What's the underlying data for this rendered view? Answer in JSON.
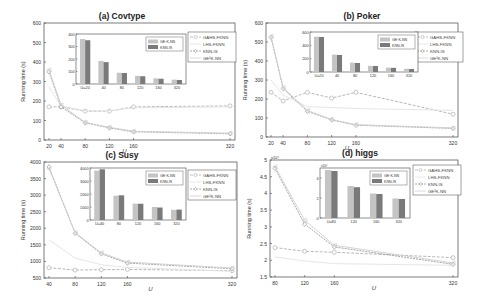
{
  "figure": {
    "ylabel": "Running time (s)",
    "xlabel": "U"
  },
  "legend_main": [
    "GAHS-FKNN",
    "LHS-FKNN",
    "KNN-IS",
    "GE²K-NN"
  ],
  "legend_inset": [
    "GE²K-NN",
    "KNN-IS"
  ],
  "colors": {
    "gahs": "#b0b0b0",
    "lhs": "#e2e2e2",
    "knnis": "#9a9a9a",
    "ge2k": "#cfcfcf",
    "bar_ge2k": "#c4c4c4",
    "bar_knnis": "#7a7a7a",
    "axis": "#444444"
  },
  "chart_data": [
    {
      "type": "line",
      "title": "(a) Covtype",
      "xlabel": "U",
      "ylabel": "Running time (s)",
      "x": [
        20,
        40,
        80,
        120,
        160,
        320
      ],
      "ylim": [
        0,
        600
      ],
      "yticks": [
        0,
        100,
        200,
        300,
        400,
        500,
        600
      ],
      "series": [
        {
          "name": "GAHS-FKNN",
          "values": [
            170,
            170,
            148,
            148,
            170,
            175
          ]
        },
        {
          "name": "LHS-FKNN",
          "values": [
            270,
            175,
            150,
            150,
            165,
            170
          ]
        },
        {
          "name": "KNN-IS",
          "values": [
            350,
            170,
            88,
            62,
            42,
            32
          ]
        },
        {
          "name": "GE²K-NN",
          "values": [
            360,
            180,
            90,
            65,
            45,
            35
          ]
        }
      ],
      "inset": {
        "type": "bar",
        "categories": [
          "U=20",
          "40",
          "80",
          "120",
          "160",
          "320"
        ],
        "ylim": [
          0,
          400
        ],
        "yticks": [
          0,
          100,
          200,
          300,
          400
        ],
        "series": [
          {
            "name": "GE²K-NN",
            "values": [
              360,
              185,
              90,
              65,
              45,
              35
            ]
          },
          {
            "name": "KNN-IS",
            "values": [
              350,
              175,
              88,
              62,
              42,
              32
            ]
          }
        ]
      }
    },
    {
      "type": "line",
      "title": "(b) Poker",
      "xlabel": "U",
      "ylabel": "Running time (s)",
      "x": [
        20,
        40,
        80,
        120,
        160,
        320
      ],
      "ylim": [
        0,
        600
      ],
      "yticks": [
        0,
        100,
        200,
        300,
        400,
        500,
        600
      ],
      "series": [
        {
          "name": "GAHS-FKNN",
          "values": [
            235,
            190,
            235,
            205,
            235,
            120
          ]
        },
        {
          "name": "LHS-FKNN",
          "values": [
            300,
            220,
            160,
            155,
            150,
            140
          ]
        },
        {
          "name": "KNN-IS",
          "values": [
            525,
            255,
            135,
            90,
            62,
            45
          ]
        },
        {
          "name": "GE²K-NN",
          "values": [
            530,
            260,
            140,
            92,
            65,
            48
          ]
        }
      ],
      "inset": {
        "type": "bar",
        "categories": [
          "U=20",
          "40",
          "80",
          "120",
          "160",
          "320"
        ],
        "ylim": [
          0,
          600
        ],
        "yticks": [
          0,
          200,
          400,
          600
        ],
        "series": [
          {
            "name": "GE²K-NN",
            "values": [
              530,
              260,
              140,
              92,
              65,
              48
            ]
          },
          {
            "name": "KNN-IS",
            "values": [
              525,
              255,
              135,
              90,
              62,
              45
            ]
          }
        ]
      }
    },
    {
      "type": "line",
      "title": "(c) Susy",
      "xlabel": "U",
      "ylabel": "Running time (s)",
      "x": [
        40,
        80,
        120,
        160,
        320
      ],
      "ylim": [
        500,
        4000
      ],
      "yticks": [
        500,
        1000,
        1500,
        2000,
        2500,
        3000,
        3500,
        4000
      ],
      "series": [
        {
          "name": "GAHS-FKNN",
          "values": [
            810,
            740,
            750,
            760,
            720
          ]
        },
        {
          "name": "LHS-FKNN",
          "values": [
            1650,
            1100,
            900,
            820,
            700
          ]
        },
        {
          "name": "KNN-IS",
          "values": [
            3850,
            1850,
            1230,
            950,
            780
          ]
        },
        {
          "name": "GE²K-NN",
          "values": [
            3800,
            1870,
            1260,
            980,
            800
          ]
        }
      ],
      "inset": {
        "type": "bar",
        "categories": [
          "U=40",
          "80",
          "120",
          "160",
          "320"
        ],
        "ylim": [
          0,
          4000
        ],
        "yticks": [
          0,
          1000,
          2000,
          3000,
          4000
        ],
        "series": [
          {
            "name": "GE²K-NN",
            "values": [
              3800,
              1870,
              1260,
              1000,
              780
            ]
          },
          {
            "name": "KNN-IS",
            "values": [
              3900,
              1900,
              1250,
              960,
              800
            ]
          }
        ]
      }
    },
    {
      "type": "line",
      "title": "(d) higgs",
      "xlabel": "U",
      "ylabel": "Running time (s)",
      "yscale_label": "x10⁴",
      "x": [
        80,
        120,
        160,
        320
      ],
      "ylim": [
        15000,
        50000
      ],
      "yticks": [
        1.5,
        2,
        2.5,
        3,
        3.5,
        4,
        4.5,
        5
      ],
      "series": [
        {
          "name": "GAHS-FKNN",
          "values": [
            23800,
            22700,
            22400,
            20800
          ]
        },
        {
          "name": "LHS-FKNN",
          "values": [
            21000,
            19800,
            19000,
            18500
          ]
        },
        {
          "name": "KNN-IS",
          "values": [
            47500,
            30800,
            24000,
            18800
          ]
        },
        {
          "name": "GE²K-NN",
          "values": [
            48000,
            32000,
            24500,
            19200
          ]
        }
      ],
      "inset": {
        "type": "bar",
        "categories": [
          "U=80",
          "120",
          "160",
          "320"
        ],
        "ylim": [
          0,
          50000
        ],
        "yticks": [
          0,
          2,
          4
        ],
        "yscale_label": "x10⁴",
        "series": [
          {
            "name": "GE²K-NN",
            "values": [
              48000,
              32000,
              24500,
              19500
            ]
          },
          {
            "name": "KNN-IS",
            "values": [
              47000,
              30800,
              24000,
              19000
            ]
          }
        ]
      }
    }
  ]
}
